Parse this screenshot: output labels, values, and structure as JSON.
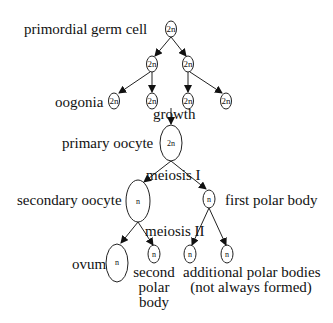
{
  "labels": {
    "primordial": "primordial germ cell",
    "oogonia": "oogonia",
    "growth": "growth",
    "primary": "primary oocyte",
    "meiosis1": "meiosis I",
    "secondary": "secondary oocyte",
    "first_polar": "first polar body",
    "meiosis2": "meiosis II",
    "ovum": "ovum",
    "second_polar_1": "second",
    "second_polar_2": "polar",
    "second_polar_3": "body",
    "additional_1": "additional polar bodies",
    "additional_2": "(not always formed)"
  },
  "cells": {
    "primordial": "2n",
    "mitosis_a": "2n",
    "mitosis_b": "2n",
    "oogonium_1": "2n",
    "oogonium_2": "2n",
    "oogonium_3": "2n",
    "oogonium_4": "2n",
    "primary": "2n",
    "secondary": "n",
    "first_polar": "n",
    "ovum": "n",
    "second_polar": "n",
    "additional_1": "n",
    "additional_2": "n"
  }
}
